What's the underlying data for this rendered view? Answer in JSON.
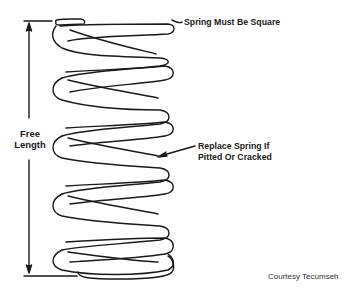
{
  "diagram": {
    "labels": {
      "square": "Spring Must Be Square",
      "free_length_line1": "Free",
      "free_length_line2": "Length",
      "replace_line1": "Replace Spring If",
      "replace_line2": "Pitted Or Cracked"
    },
    "credit": "Courtesy Tecumseh",
    "colors": {
      "line": "#1a1a1a",
      "background": "#ffffff"
    }
  }
}
